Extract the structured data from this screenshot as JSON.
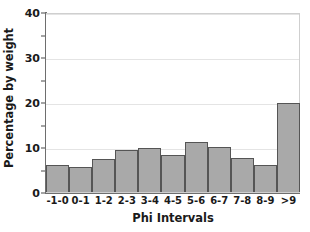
{
  "chart_data": {
    "type": "bar",
    "title": "",
    "subtitle": "",
    "xlabel": "Phi Intervals",
    "ylabel": "Percentage by weight",
    "categories": [
      "-1-0",
      "0-1",
      "1-2",
      "2-3",
      "3-4",
      "4-5",
      "5-6",
      "6-7",
      "7-8",
      "8-9",
      ">9"
    ],
    "values": [
      6.0,
      5.5,
      7.4,
      9.4,
      9.7,
      8.2,
      11.2,
      10.0,
      7.6,
      6.1,
      19.7
    ],
    "ylim": [
      0,
      40
    ],
    "xlim": [
      0,
      11
    ],
    "y_major_ticks": [
      0,
      10,
      20,
      30,
      40
    ],
    "y_minor_ticks": [
      5,
      15,
      25,
      35
    ],
    "y_tick_labels": [
      "0",
      "10",
      "20",
      "30",
      "40"
    ],
    "grid": true,
    "grid_axis": "y",
    "legend": false,
    "legend_position": "none",
    "bar_color": "#a9a9a9",
    "bar_edge_color": "#555555",
    "grid_color": "#e4e4e4",
    "axis_color": "#6e6e6e",
    "text_color": "#1a1a1a",
    "background": "#ffffff"
  }
}
